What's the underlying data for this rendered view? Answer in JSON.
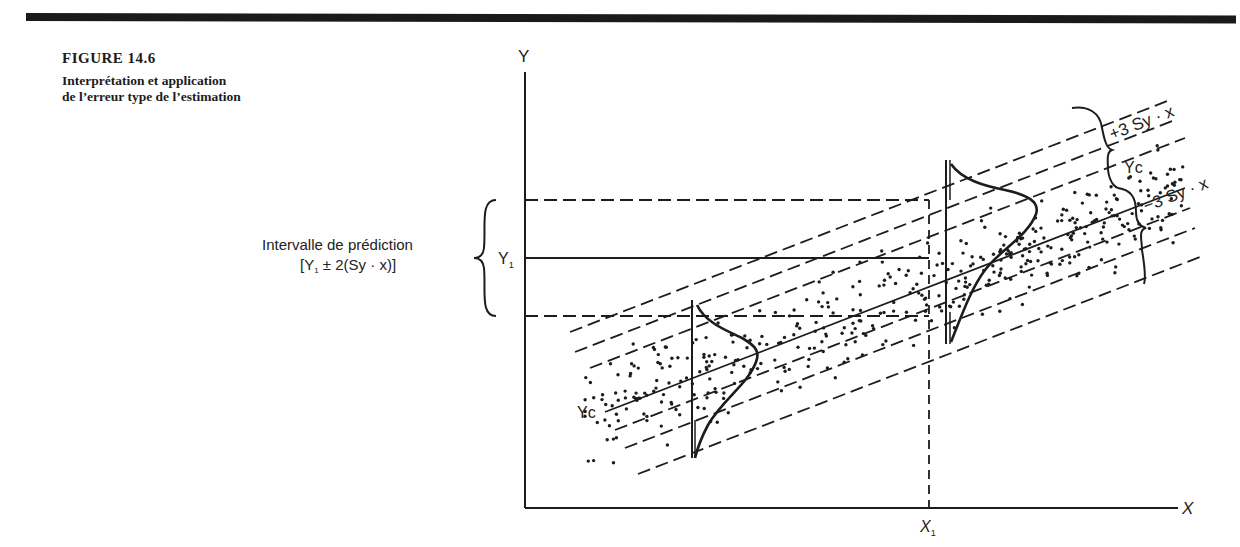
{
  "caption": {
    "figure_number": "FIGURE 14.6",
    "title_line1": "Interprétation et application",
    "title_line2": "de l’erreur type de l’estimation"
  },
  "axes": {
    "y_label": "Y",
    "x_label": "X",
    "x1_label": "X",
    "x1_sub": "1",
    "y1_label": "Y",
    "y1_sub": "1"
  },
  "annotations": {
    "interval_line1": "Intervalle de prédiction",
    "interval_line2_open": "[Y",
    "interval_line2_sub": "1",
    "interval_line2_rest": " ± 2(Sy · x)]",
    "plus3": "+3 Sy · x",
    "minus3": "−3 Sy · x",
    "yc_right": "Yc",
    "yc_left": "Yc"
  },
  "colors": {
    "ink": "#1c1c1c",
    "background": "#ffffff"
  }
}
